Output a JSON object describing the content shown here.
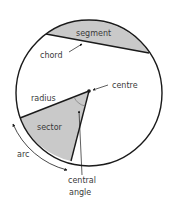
{
  "diagram": {
    "colors": {
      "stroke": "#1a1a1a",
      "fill": "#c9c9c9",
      "text": "#3a3a3a",
      "background": "#ffffff"
    },
    "labels": {
      "segment": "segment",
      "chord": "chord",
      "centre": "centre",
      "radius": "radius",
      "sector": "sector",
      "arc": "arc",
      "central_angle_line1": "central",
      "central_angle_line2": "angle"
    }
  }
}
